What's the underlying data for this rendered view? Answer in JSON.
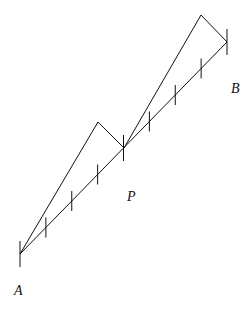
{
  "diagram": {
    "points": {
      "A": {
        "label": "A",
        "x": 20,
        "y": 254,
        "label_x": 14,
        "label_y": 284
      },
      "P": {
        "label": "P",
        "x": 124,
        "y": 148,
        "label_x": 127,
        "label_y": 190
      },
      "B": {
        "label": "B",
        "x": 227,
        "y": 42,
        "label_x": 231,
        "label_y": 82
      }
    },
    "peaks": [
      {
        "x": 98,
        "y": 122
      },
      {
        "x": 201,
        "y": 15
      }
    ],
    "tick_count": 9,
    "tick_half_length": 13,
    "small_tick_half_length": 10,
    "stroke_color": "#111111"
  }
}
